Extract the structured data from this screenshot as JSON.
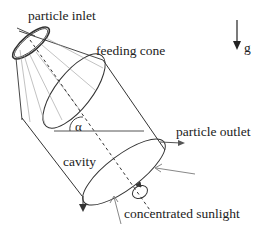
{
  "diagram": {
    "type": "schematic",
    "labels": {
      "particle_inlet": "particle inlet",
      "feeding_cone": "feeding cone",
      "gravity": "g",
      "angle": "α",
      "particle_outlet": "particle outlet",
      "cavity": "cavity",
      "concentrated_sunlight": "concentrated sunlight"
    },
    "colors": {
      "line": "#333333",
      "light_line": "#999999",
      "sunlight_arrow": "#888888"
    }
  }
}
